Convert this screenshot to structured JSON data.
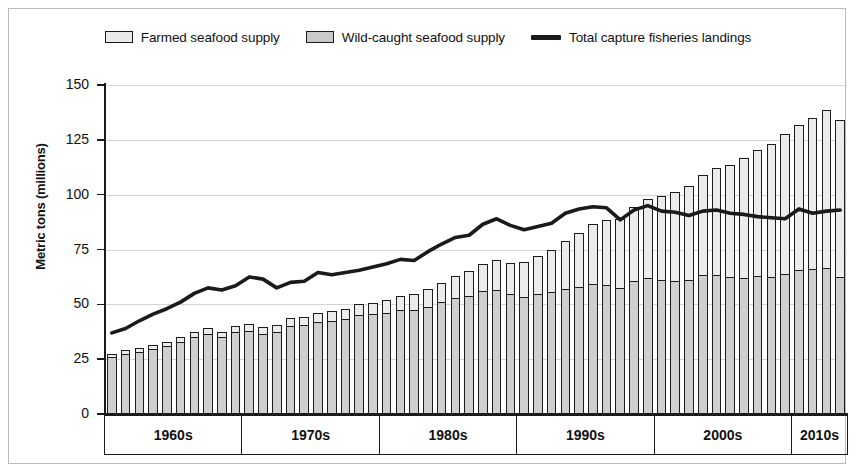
{
  "chart_data": {
    "type": "bar",
    "title": "",
    "subtitle": "",
    "xlabel": "",
    "ylabel": "Metric tons (millions)",
    "ylim": [
      0,
      150
    ],
    "yticks": [
      0,
      25,
      50,
      75,
      100,
      125,
      150
    ],
    "grid": true,
    "legend_position": "top-center",
    "stacked": true,
    "x_group_labels": [
      "1960s",
      "1970s",
      "1980s",
      "1990s",
      "2010s",
      "2010s"
    ],
    "categories": [
      1961,
      1962,
      1963,
      1964,
      1965,
      1966,
      1967,
      1968,
      1969,
      1970,
      1971,
      1972,
      1973,
      1974,
      1975,
      1976,
      1977,
      1978,
      1979,
      1980,
      1981,
      1982,
      1983,
      1984,
      1985,
      1986,
      1987,
      1988,
      1989,
      1990,
      1991,
      1992,
      1993,
      1994,
      1995,
      1996,
      1997,
      1998,
      1999,
      2000,
      2001,
      2002,
      2003,
      2004,
      2005,
      2006,
      2007,
      2008,
      2009,
      2010,
      2011,
      2012,
      2013,
      2014
    ],
    "series": [
      {
        "name": "Wild-caught seafood supply",
        "color": "#cfcfcf",
        "values": [
          26.0,
          27.5,
          28.3,
          29.8,
          31.0,
          33.0,
          35.2,
          36.5,
          35.0,
          37.5,
          38.0,
          36.5,
          37.5,
          40.0,
          40.5,
          42.0,
          42.5,
          43.5,
          45.0,
          45.5,
          46.0,
          47.5,
          47.5,
          49.0,
          51.0,
          53.0,
          54.0,
          56.0,
          56.5,
          54.5,
          53.5,
          54.5,
          55.5,
          57.0,
          58.0,
          59.5,
          59.0,
          57.5,
          60.5,
          62.0,
          61.0,
          60.5,
          61.0,
          63.5,
          63.5,
          62.5,
          62.0,
          63.0,
          62.5,
          64.0,
          65.5,
          66.0,
          66.5,
          62.5
        ]
      },
      {
        "name": "Farmed seafood supply",
        "color": "#ebebeb",
        "values": [
          1.5,
          1.6,
          1.7,
          1.8,
          2.0,
          2.1,
          2.3,
          2.5,
          2.6,
          2.8,
          2.9,
          3.1,
          3.3,
          3.6,
          3.8,
          4.1,
          4.3,
          4.6,
          5.0,
          5.3,
          5.8,
          6.4,
          7.0,
          7.8,
          8.7,
          10.0,
          11.2,
          12.5,
          13.5,
          14.5,
          16.0,
          17.5,
          19.5,
          22.0,
          24.5,
          27.0,
          29.5,
          31.5,
          34.0,
          36.0,
          38.5,
          40.5,
          43.0,
          45.5,
          48.5,
          51.0,
          54.5,
          57.5,
          60.5,
          63.5,
          66.5,
          69.0,
          72.0,
          71.5
        ]
      }
    ],
    "line_series": {
      "name": "Total capture fisheries landings",
      "color": "#1a1a1a",
      "values": [
        37.0,
        39.0,
        42.5,
        45.5,
        48.0,
        51.0,
        55.0,
        57.5,
        56.5,
        58.5,
        62.5,
        61.5,
        57.5,
        60.0,
        60.5,
        64.5,
        63.5,
        64.5,
        65.5,
        67.0,
        68.5,
        70.5,
        70.0,
        74.0,
        77.5,
        80.5,
        81.5,
        86.5,
        89.0,
        86.0,
        84.0,
        85.5,
        87.0,
        91.5,
        93.5,
        94.5,
        94.0,
        88.5,
        93.0,
        95.0,
        92.5,
        92.0,
        90.5,
        92.5,
        93.0,
        91.5,
        91.0,
        90.0,
        89.5,
        89.0,
        93.5,
        91.5,
        92.5,
        93.0
      ]
    }
  },
  "legend": {
    "items": [
      {
        "label": "Farmed seafood supply",
        "swatch": "farmed-swatch"
      },
      {
        "label": "Wild-caught seafood supply",
        "swatch": "wild-swatch"
      },
      {
        "label": "Total capture fisheries landings",
        "swatch": "line-swatch"
      }
    ]
  },
  "axes": {
    "y_title": "Metric tons (millions)",
    "y_tick_labels": [
      "150",
      "125",
      "100",
      "75",
      "50",
      "25",
      "0"
    ],
    "x_group_labels": [
      "1960s",
      "1970s",
      "1980s",
      "1990s",
      "2000s",
      "2010s"
    ]
  },
  "colors": {
    "farmed": "#ebebeb",
    "wild": "#cfcfcf",
    "line": "#1a1a1a",
    "grid": "#d4d4d4",
    "axis": "#1a1a1a",
    "frame": "#b9b9b9"
  }
}
